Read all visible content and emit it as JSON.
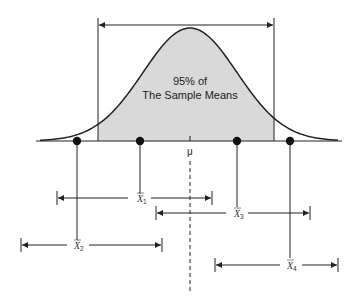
{
  "diagram": {
    "title_line1": "95% of",
    "title_line2": "The Sample Means",
    "mean_symbol": "μ",
    "colors": {
      "line": "#222222",
      "shade": "#d9d9d9",
      "background": "#ffffff"
    },
    "curve": {
      "type": "normal-distribution",
      "center_label": "μ",
      "shaded_range": "central 95%"
    },
    "sample_means": [
      {
        "symbol": "X",
        "subscript": "1",
        "point_position": "inside-left",
        "interval_contains_mean": true
      },
      {
        "symbol": "X",
        "subscript": "2",
        "point_position": "outside-left",
        "interval_contains_mean": false
      },
      {
        "symbol": "X",
        "subscript": "3",
        "point_position": "inside-right",
        "interval_contains_mean": true
      },
      {
        "symbol": "X",
        "subscript": "4",
        "point_position": "outside-right",
        "interval_contains_mean": false
      }
    ]
  }
}
